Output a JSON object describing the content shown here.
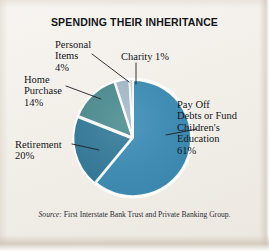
{
  "figure": {
    "title": "SPENDING THEIR INHERITANCE",
    "background_color": "#f2efe9",
    "source_prefix": "Source:",
    "source_text": " First Interstate Bank Trust and Private Banking Group."
  },
  "labels": {
    "personal_items": "Personal\nItems\n4%",
    "charity": "Charity 1%",
    "home_purchase": "Home\nPurchase\n14%",
    "retirement": "Retirement\n20%",
    "payoff": "Pay Off\nDebts or Fund\nChildren's\nEducation\n61%"
  },
  "chart_data": {
    "type": "pie",
    "title": "SPENDING THEIR INHERITANCE",
    "categories": [
      "Pay Off Debts or Fund Children's Education",
      "Retirement",
      "Home Purchase",
      "Personal Items",
      "Charity"
    ],
    "values": [
      61,
      20,
      14,
      4,
      1
    ],
    "unit": "percent",
    "total": 100,
    "colors": [
      "#3d8fb8",
      "#357d9c",
      "#4d8e92",
      "#a8bdcc",
      "#c9d4dc"
    ],
    "slice_separator_color": "#ffffff",
    "start_angle_deg": 0,
    "direction": "clockwise",
    "legend": "none",
    "labels_style": "external-with-leader-lines",
    "annotations": [
      "Personal Items 4%",
      "Charity 1%",
      "Home Purchase 14%",
      "Retirement 20%",
      "Pay Off Debts or Fund Children's Education 61%"
    ],
    "source": "Source: First Interstate Bank Trust and Private Banking Group."
  }
}
